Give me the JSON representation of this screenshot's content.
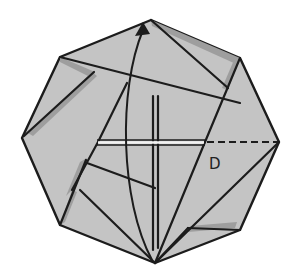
{
  "diagram": {
    "type": "origami-fold-step",
    "shape": "octagon",
    "colors": {
      "paper": "#c4c4c4",
      "paper_shadow": "#9a9a9a",
      "line": "#1c1c1c",
      "highlight": "#f2f2f2",
      "background": "#ffffff"
    },
    "labels": [
      {
        "id": "D",
        "text": "D"
      }
    ],
    "annotations": {
      "arrow": "curved fold arrow from bottom vertex to top vertex",
      "dashed_line": "valley fold line from center to right vertex"
    }
  }
}
